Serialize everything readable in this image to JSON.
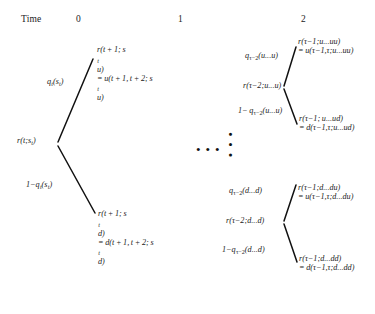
{
  "header": {
    "time_label": "Time",
    "columns": [
      "0",
      "1",
      "2"
    ]
  },
  "left_tree": {
    "root": "r(t;s",
    "root_sub": "t",
    "root_tail": ")",
    "prob_up": "q",
    "prob_up_sub": "t",
    "prob_up_tail": "(s",
    "prob_up_sub2": "t",
    "prob_up_end": ")",
    "prob_down_prefix": "1−q",
    "prob_down_sub": "t",
    "prob_down_tail": "(s",
    "prob_down_sub2": "t",
    "prob_down_end": ")",
    "up_node_line1_a": "r(t + 1; s",
    "up_node_line1_sub": "t",
    "up_node_line1_b": "u)",
    "up_node_line2_a": "= u(t + 1, t + 2; s",
    "up_node_line2_sub": "t",
    "up_node_line2_b": "u)",
    "down_node_line1_a": "r(t + 1; s",
    "down_node_line1_sub": "t",
    "down_node_line1_b": "d)",
    "down_node_line2_a": "= d(t + 1, t + 2; s",
    "down_node_line2_sub": "t",
    "down_node_line2_b": "d)"
  },
  "ellipsis": {
    "horizontal": "• • •",
    "vertical": "• • •"
  },
  "upper_right_tree": {
    "root_a": "r(τ−2;u...u)",
    "prob_up_a": "q",
    "prob_up_sub": "τ−2",
    "prob_up_b": "(u...u)",
    "prob_down_a": "1− q",
    "prob_down_sub": "τ−2",
    "prob_down_b": "(u...u)",
    "up_node_line1": "r(τ−1;u...uu)",
    "up_node_line2": "= u(τ−1,τ;u...uu)",
    "down_node_line1": "r(τ−1; u...ud)",
    "down_node_line2": "= d(τ−1,τ;u...ud)"
  },
  "lower_right_tree": {
    "root_a": "r(τ−2;d...d)",
    "prob_up_a": "q",
    "prob_up_sub": "τ−2",
    "prob_up_b": "(d...d)",
    "prob_down_a": "1−q",
    "prob_down_sub": "τ−2",
    "prob_down_b": "(d...d)",
    "up_node_line1": "r(τ−1;d...du)",
    "up_node_line2": "= u(τ−1,τ;d...du)",
    "down_node_line1": "r(τ−1;d...dd)",
    "down_node_line2": "= d(τ−1,τ;d...dd)"
  },
  "style": {
    "branch_color": "#111111",
    "text_color": "#1a1a1a",
    "background": "#ffffff"
  }
}
